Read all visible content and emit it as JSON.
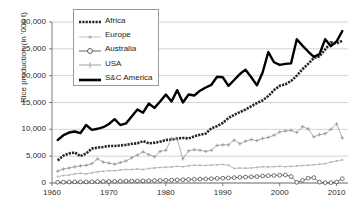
{
  "chart_data": {
    "type": "line",
    "title": "",
    "xlabel": "",
    "ylabel": "Rice production (in '000 t)",
    "xlim": [
      1960,
      2012
    ],
    "ylim": [
      0,
      30000
    ],
    "ytick_labels": [
      "30,000",
      "25,000",
      "20,000",
      "15,000",
      "10,000",
      "5,000",
      "0"
    ],
    "ytick_values": [
      30000,
      25000,
      20000,
      15000,
      10000,
      5000,
      0
    ],
    "xtick_labels": [
      "1960",
      "1970",
      "1980",
      "1990",
      "2000",
      "2010"
    ],
    "xtick_values": [
      1960,
      1970,
      1980,
      1990,
      2000,
      2010
    ],
    "grid": true,
    "legend_position": "top-left-inside",
    "x": [
      1961,
      1962,
      1963,
      1964,
      1965,
      1966,
      1967,
      1968,
      1969,
      1970,
      1971,
      1972,
      1973,
      1974,
      1975,
      1976,
      1977,
      1978,
      1979,
      1980,
      1981,
      1982,
      1983,
      1984,
      1985,
      1986,
      1987,
      1988,
      1989,
      1990,
      1991,
      1992,
      1993,
      1994,
      1995,
      1996,
      1997,
      1998,
      1999,
      2000,
      2001,
      2002,
      2003,
      2004,
      2005,
      2006,
      2007,
      2008,
      2009,
      2010,
      2011
    ],
    "series": [
      {
        "name": "Africa",
        "marker": "thick-dotted-dark",
        "color": "#262626",
        "values": [
          4200,
          5100,
          5500,
          5700,
          5000,
          5500,
          6400,
          6600,
          6700,
          6900,
          6900,
          7000,
          7100,
          7300,
          7400,
          7800,
          7400,
          7500,
          7700,
          8000,
          8100,
          8300,
          8400,
          8300,
          8700,
          9000,
          9200,
          10200,
          10600,
          11200,
          12100,
          12700,
          13200,
          13700,
          14300,
          14900,
          15400,
          16200,
          17300,
          18100,
          18400,
          19000,
          20000,
          21200,
          22200,
          23300,
          23600,
          24900,
          26200,
          26000,
          26500
        ]
      },
      {
        "name": "Europe",
        "marker": "small-dot-light",
        "color": "#b3b3b3",
        "values": [
          1200,
          1400,
          1500,
          1700,
          1800,
          1700,
          1900,
          2100,
          2200,
          2300,
          2300,
          2400,
          2500,
          2500,
          2600,
          2500,
          2700,
          2800,
          2900,
          2950,
          3000,
          3100,
          3050,
          3200,
          3300,
          3300,
          3250,
          3350,
          3400,
          3450,
          3300,
          2700,
          2800,
          2750,
          2800,
          2900,
          3050,
          3000,
          3050,
          3100,
          3050,
          3100,
          3150,
          3250,
          3300,
          3400,
          3500,
          3600,
          3900,
          4100,
          4300
        ]
      },
      {
        "name": "Australia",
        "marker": "open-circle",
        "color": "#3a3a3a",
        "values": [
          140,
          160,
          180,
          200,
          200,
          210,
          230,
          260,
          280,
          300,
          310,
          330,
          350,
          360,
          380,
          400,
          420,
          450,
          480,
          500,
          540,
          580,
          620,
          650,
          680,
          720,
          760,
          800,
          850,
          900,
          950,
          1000,
          1050,
          1100,
          1150,
          1200,
          1300,
          1350,
          1400,
          1450,
          1500,
          1200,
          120,
          500,
          900,
          1000,
          160,
          60,
          60,
          200,
          800
        ]
      },
      {
        "name": "USA",
        "marker": "plus",
        "color": "#8c8c8c",
        "values": [
          2200,
          2600,
          2800,
          3000,
          3200,
          3300,
          3600,
          4500,
          3900,
          3700,
          3500,
          3800,
          4100,
          4700,
          5200,
          5800,
          5300,
          4900,
          5900,
          6100,
          8300,
          8100,
          4500,
          6000,
          6200,
          6100,
          5900,
          6100,
          7000,
          7100,
          7100,
          8000,
          7300,
          7800,
          8100,
          7900,
          8300,
          8500,
          8900,
          9500,
          9700,
          9800,
          9400,
          10500,
          10100,
          8600,
          9000,
          9200,
          10000,
          11000,
          8400
        ]
      },
      {
        "name": "S&C America",
        "marker": "thick-solid-black",
        "color": "#000000",
        "values": [
          8000,
          8900,
          9400,
          9600,
          9300,
          10800,
          9900,
          10100,
          10400,
          11000,
          11900,
          10800,
          11100,
          12400,
          13700,
          13100,
          14800,
          14000,
          15200,
          16500,
          15200,
          17300,
          15000,
          16500,
          16300,
          17200,
          17800,
          18300,
          19800,
          19700,
          18100,
          19200,
          20300,
          21100,
          19700,
          18200,
          20600,
          24400,
          22500,
          22000,
          22200,
          22300,
          26800,
          25600,
          24500,
          23500,
          24000,
          26800,
          25500,
          26400,
          28300
        ]
      }
    ]
  },
  "legend": {
    "items": [
      {
        "label": "Africa"
      },
      {
        "label": "Europe"
      },
      {
        "label": "Australia"
      },
      {
        "label": "USA"
      },
      {
        "label": "S&C America"
      }
    ]
  }
}
